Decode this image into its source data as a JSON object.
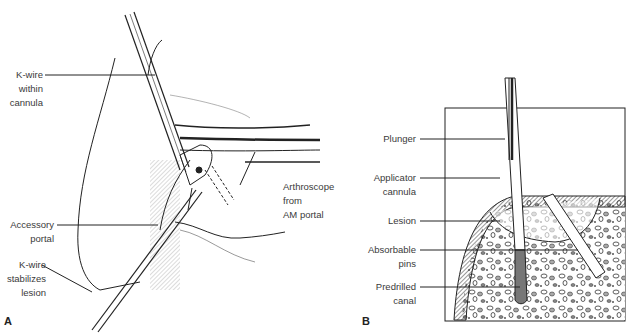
{
  "panels": {
    "a": {
      "letter": "A",
      "labels": {
        "kwire_cannula": [
          "K-wire",
          "within",
          "cannula"
        ],
        "accessory_portal": [
          "Accessory",
          "portal"
        ],
        "kwire_stabilizes": [
          "K-wire",
          "stabilizes",
          "lesion"
        ],
        "arthroscope": [
          "Arthroscope",
          "from",
          "AM portal"
        ]
      }
    },
    "b": {
      "letter": "B",
      "labels": {
        "plunger": [
          "Plunger"
        ],
        "applicator": [
          "Applicator",
          "cannula"
        ],
        "lesion": [
          "Lesion"
        ],
        "pins": [
          "Absorbable",
          "pins"
        ],
        "canal": [
          "Predrilled",
          "canal"
        ]
      }
    }
  },
  "colors": {
    "ink": "#222222",
    "text": "#3a3a3a",
    "background": "#ffffff"
  }
}
